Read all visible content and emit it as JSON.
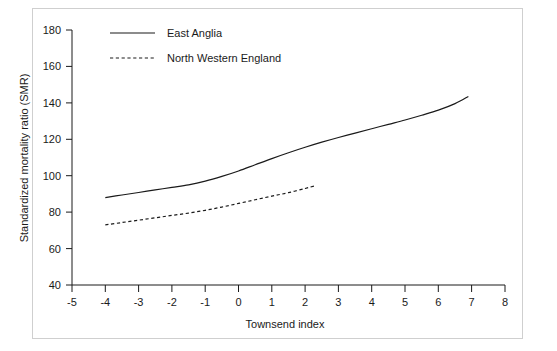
{
  "chart_data": {
    "type": "line",
    "title": "",
    "xlabel": "Townsend index",
    "ylabel": "Standardized mortality ratio (SMR)",
    "xlim": [
      -5,
      8
    ],
    "ylim": [
      40,
      180
    ],
    "xticks": [
      "-5",
      "-4",
      "-3",
      "-2",
      "-1",
      "0",
      "1",
      "2",
      "3",
      "4",
      "5",
      "6",
      "7",
      "8"
    ],
    "xtick_values": [
      -5,
      -4,
      -3,
      -2,
      -1,
      0,
      1,
      2,
      3,
      4,
      5,
      6,
      7,
      8
    ],
    "yticks": [
      "40",
      "60",
      "80",
      "100",
      "120",
      "140",
      "160",
      "180"
    ],
    "ytick_values": [
      40,
      60,
      80,
      100,
      120,
      140,
      160,
      180
    ],
    "grid": false,
    "legend_position": "top-left-inside",
    "series": [
      {
        "name": "East Anglia",
        "style": "solid",
        "color": "#1a1a1a",
        "x": [
          -4.0,
          -3.5,
          -3.0,
          -2.5,
          -2.0,
          -1.5,
          -1.0,
          -0.5,
          0.0,
          0.5,
          1.0,
          1.5,
          2.0,
          2.5,
          3.0,
          3.5,
          4.0,
          4.5,
          5.0,
          5.5,
          6.0,
          6.5,
          6.9
        ],
        "y": [
          88.0,
          89.4,
          90.8,
          92.2,
          93.6,
          95.0,
          97.0,
          99.6,
          102.6,
          106.0,
          109.4,
          112.6,
          115.6,
          118.4,
          121.0,
          123.4,
          125.8,
          128.2,
          130.6,
          133.2,
          136.0,
          139.6,
          143.5
        ]
      },
      {
        "name": "North Western England",
        "style": "dashed",
        "color": "#1a1a1a",
        "x": [
          -4.0,
          -3.5,
          -3.0,
          -2.5,
          -2.0,
          -1.5,
          -1.0,
          -0.5,
          0.0,
          0.5,
          1.0,
          1.5,
          2.0,
          2.3
        ],
        "y": [
          73.0,
          74.3,
          75.6,
          76.9,
          78.2,
          79.5,
          81.0,
          82.8,
          84.8,
          86.8,
          88.8,
          90.7,
          93.0,
          94.5
        ]
      }
    ]
  },
  "legend": {
    "items": [
      {
        "label": "East Anglia",
        "style": "solid"
      },
      {
        "label": "North Western England",
        "style": "dashed"
      }
    ]
  }
}
